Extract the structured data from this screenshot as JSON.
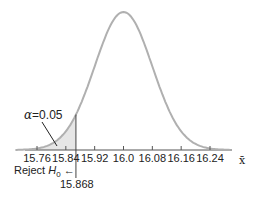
{
  "chart_data": {
    "type": "line",
    "title": "",
    "xlabel": "x̄",
    "ylabel": "",
    "mean": 16.0,
    "x_ticks": [
      "15.76",
      "15.84",
      "15.92",
      "16.0",
      "16.08",
      "16.16",
      "16.24"
    ],
    "critical_value": "15.868",
    "alpha_label": "α = 0.05",
    "alpha_value": 0.05,
    "reject_label": "Reject H0",
    "xlim": [
      15.72,
      16.3
    ],
    "grid": false,
    "curve_color": "#b0b0b0",
    "shade_color": "#e6e6e6"
  },
  "labels": {
    "alpha_symbol": "α",
    "alpha_eq": "=0.05",
    "reject": "Reject ",
    "h": "H",
    "h_sub": "0",
    "arrow": "←",
    "critical": "15.868",
    "xbar": "x̄"
  }
}
